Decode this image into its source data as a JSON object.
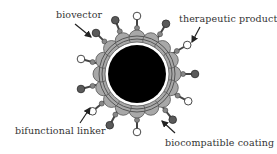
{
  "diagram": {
    "labels": {
      "biovector": "biovector",
      "therapeutic_product": "therapeutic product",
      "bifunctional_linker": "bifunctional linker",
      "biocompatible_coating": "biocompatible coating"
    },
    "colors": {
      "core": "#000000",
      "coating": "#a8a8a8",
      "coating_stroke": "#555555",
      "biovector_ball": "#5a5a5a",
      "therapeutic_ball": "#ffffff",
      "text": "#333333"
    },
    "spikes": [
      {
        "angle": -90,
        "type": "therapeutic"
      },
      {
        "angle": -60,
        "type": "biovector"
      },
      {
        "angle": -30,
        "type": "therapeutic"
      },
      {
        "angle": 0,
        "type": "biovector"
      },
      {
        "angle": 28,
        "type": "therapeutic"
      },
      {
        "angle": 52,
        "type": "biovector"
      },
      {
        "angle": 90,
        "type": "therapeutic"
      },
      {
        "angle": 118,
        "type": "biovector"
      },
      {
        "angle": 140,
        "type": "therapeutic"
      },
      {
        "angle": 165,
        "type": "biovector"
      },
      {
        "angle": 195,
        "type": "therapeutic"
      },
      {
        "angle": 225,
        "type": "biovector"
      },
      {
        "angle": 248,
        "type": "biovector"
      }
    ]
  }
}
